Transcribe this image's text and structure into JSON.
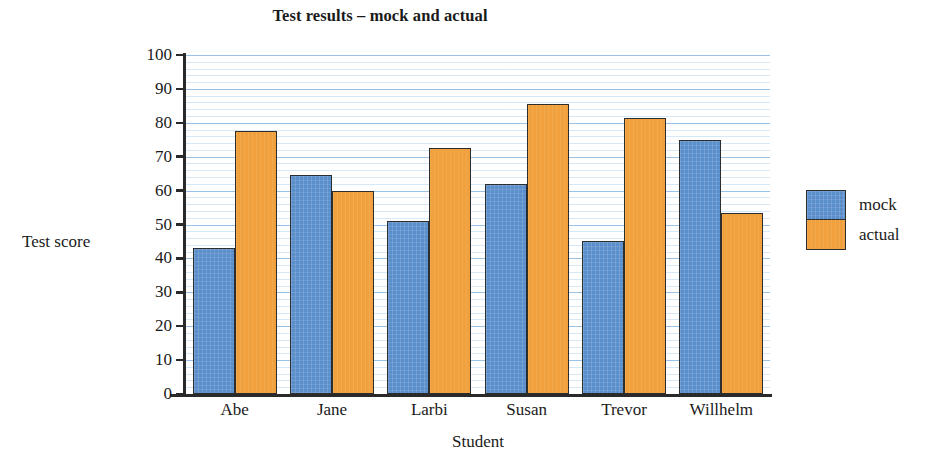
{
  "chart_data": {
    "type": "bar",
    "title": "Test results – mock and actual",
    "xlabel": "Student",
    "ylabel": "Test score",
    "categories": [
      "Abe",
      "Jane",
      "Larbi",
      "Susan",
      "Trevor",
      "Willhelm"
    ],
    "series": [
      {
        "name": "mock",
        "color": "#5B8FCB",
        "values": [
          43,
          64.5,
          51,
          62,
          45,
          75
        ]
      },
      {
        "name": "actual",
        "color": "#F0A03C",
        "values": [
          77.5,
          60,
          72.5,
          85.5,
          81.5,
          53.5
        ]
      }
    ],
    "ylim": [
      0,
      100
    ],
    "y_ticks": [
      0,
      10,
      20,
      30,
      40,
      50,
      60,
      70,
      80,
      90,
      100
    ],
    "y_tick_labels": [
      "0",
      "10",
      "20",
      "30",
      "40",
      "50",
      "60",
      "70",
      "80",
      "90",
      "100"
    ],
    "y_minor_step": 2,
    "grid": true,
    "grid_color": "#8CB9E1",
    "legend_position": "right",
    "legend": [
      {
        "label": "mock",
        "color": "#5B8FCB"
      },
      {
        "label": "actual",
        "color": "#F0A03C"
      }
    ],
    "background_color": "#FFFFFF",
    "axis_color": "#2A2A2A"
  }
}
